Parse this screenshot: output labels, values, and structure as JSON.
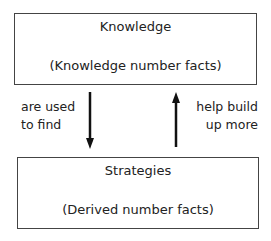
{
  "top_box": {
    "title": "Knowledge",
    "subtitle": "(Knowledge number facts)"
  },
  "bottom_box": {
    "title": "Strategies",
    "subtitle": "(Derived number facts)"
  },
  "left_label": {
    "line1": "are used",
    "line2": "to find"
  },
  "right_label": {
    "line1": "help build",
    "line2": "up more"
  }
}
